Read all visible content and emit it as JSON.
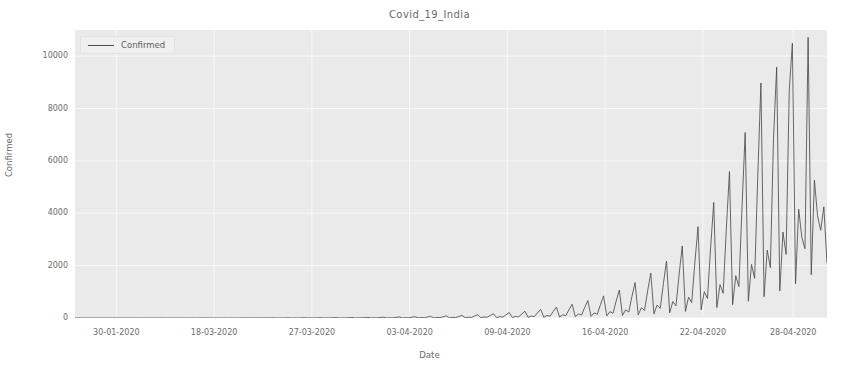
{
  "chart_data": {
    "type": "line",
    "title": "Covid_19_India",
    "xlabel": "Date",
    "ylabel": "Confirmed",
    "ylim": [
      0,
      11000
    ],
    "yticks": [
      0,
      2000,
      4000,
      6000,
      8000,
      10000
    ],
    "ytick_labels": [
      "0",
      "2000",
      "4000",
      "6000",
      "8000",
      "10000"
    ],
    "xtick_labels": [
      "30-01-2020",
      "18-03-2020",
      "27-03-2020",
      "03-04-2020",
      "09-04-2020",
      "16-04-2020",
      "22-04-2020",
      "28-04-2020"
    ],
    "xtick_positions_frac": [
      0.055,
      0.185,
      0.315,
      0.445,
      0.575,
      0.705,
      0.835,
      0.955
    ],
    "grid": true,
    "legend": {
      "position": "upper left",
      "entries": [
        {
          "name": "Confirmed",
          "color": "#4b4b52"
        }
      ]
    },
    "series": [
      {
        "name": "Confirmed",
        "color": "#4b4b52",
        "note": "State-wise confirmed counts recorded sequentially per date, producing repeating spike groups that grow over time.",
        "values": [
          1,
          1,
          0,
          2,
          1,
          0,
          1,
          2,
          0,
          1,
          1,
          0,
          2,
          1,
          1,
          0,
          1,
          2,
          1,
          0,
          1,
          1,
          2,
          1,
          0,
          2,
          1,
          1,
          2,
          0,
          1,
          2,
          1,
          1,
          0,
          2,
          1,
          2,
          1,
          0,
          2,
          1,
          3,
          1,
          0,
          2,
          1,
          3,
          2,
          0,
          3,
          1,
          2,
          4,
          0,
          2,
          1,
          3,
          5,
          1,
          3,
          2,
          4,
          6,
          1,
          3,
          2,
          5,
          7,
          1,
          4,
          2,
          6,
          9,
          1,
          4,
          3,
          7,
          12,
          2,
          5,
          3,
          9,
          15,
          2,
          6,
          4,
          11,
          19,
          2,
          7,
          5,
          14,
          24,
          3,
          8,
          6,
          18,
          31,
          3,
          10,
          7,
          23,
          39,
          4,
          12,
          9,
          29,
          49,
          5,
          15,
          11,
          37,
          63,
          6,
          19,
          14,
          47,
          80,
          8,
          24,
          18,
          60,
          101,
          10,
          30,
          22,
          76,
          128,
          12,
          38,
          28,
          97,
          162,
          15,
          48,
          35,
          123,
          205,
          19,
          60,
          44,
          156,
          260,
          24,
          76,
          56,
          198,
          329,
          30,
          96,
          71,
          251,
          416,
          38,
          121,
          90,
          318,
          527,
          48,
          153,
          113,
          403,
          667,
          61,
          194,
          143,
          510,
          845,
          77,
          245,
          181,
          646,
          1070,
          97,
          310,
          229,
          818,
          1355,
          123,
          392,
          290,
          1036,
          1716,
          156,
          496,
          367,
          1312,
          2173,
          197,
          628,
          465,
          1662,
          2752,
          250,
          795,
          589,
          2105,
          3486,
          316,
          1007,
          746,
          2666,
          4416,
          400,
          1275,
          945,
          3377,
          5594,
          507,
          1615,
          1197,
          4278,
          7085,
          642,
          2045,
          1516,
          5419,
          8974,
          813,
          2590,
          1920,
          6864,
          9580,
          1030,
          3280,
          2432,
          8694,
          10498,
          1304,
          4154,
          3080,
          2646,
          10720,
          1652,
          5261,
          3902,
          3352,
          4246,
          2092
        ]
      }
    ]
  }
}
